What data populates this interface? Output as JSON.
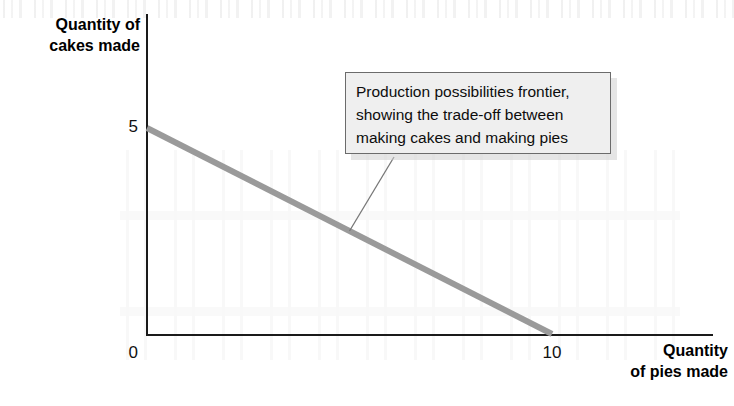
{
  "figure": {
    "background_color": "#ffffff",
    "axis_color": "#1a1a1a",
    "ppf_color": "#9a9a9a",
    "callout_fill": "#efefef",
    "callout_border": "#6b6b6b"
  },
  "axes": {
    "y_title": "Quantity of\ncakes made",
    "x_title": "Quantity\nof pies made",
    "origin_label": "0",
    "y_tick_label": "5",
    "x_tick_label": "10"
  },
  "annotation": {
    "text": "Production possibilities frontier,\nshowing the trade-off between\nmaking cakes and making pies",
    "line1": "Production possibilities frontier,",
    "line2": "showing the trade-off between",
    "line3": "making cakes and making pies"
  },
  "chart_data": {
    "type": "line",
    "title": "",
    "subtitle": "",
    "xlabel": "Quantity of pies made",
    "ylabel": "Quantity of cakes made",
    "xlim": [
      0,
      14
    ],
    "ylim": [
      0,
      6.4
    ],
    "xticks": [
      0,
      10
    ],
    "xticklabels": [
      "0",
      "10"
    ],
    "yticks": [
      0,
      5
    ],
    "yticklabels": [
      "0",
      "5"
    ],
    "grid": false,
    "legend": false,
    "legend_position": "none",
    "series": [
      {
        "name": "Production possibilities frontier",
        "color": "#9a9a9a",
        "linewidth": 6,
        "x": [
          0,
          10
        ],
        "y": [
          5,
          0
        ]
      }
    ],
    "annotations": [
      {
        "text": "Production possibilities frontier, showing the trade-off between making cakes and making pies",
        "boxed": true,
        "anchor_x": 5.0,
        "anchor_y": 2.5
      }
    ]
  }
}
